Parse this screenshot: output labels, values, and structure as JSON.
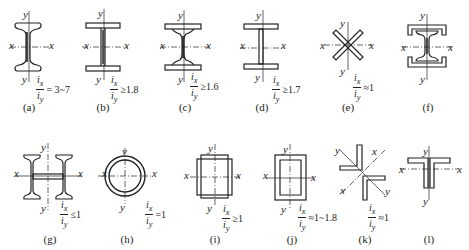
{
  "axes": {
    "x": "x",
    "y": "y"
  },
  "ratio": {
    "num": "i",
    "num_sub": "x",
    "den": "i",
    "den_sub": "y"
  },
  "figures": [
    {
      "id": "a",
      "caption": "(a)",
      "shape": "rolled-i-beam",
      "relation": "= 3~7"
    },
    {
      "id": "b",
      "caption": "(b)",
      "shape": "wide-flange-h-beam",
      "relation": "≥1.8"
    },
    {
      "id": "c",
      "caption": "(c)",
      "shape": "i-beam-with-cover-plates",
      "relation": "≥1.6"
    },
    {
      "id": "d",
      "caption": "(d)",
      "shape": "welded-i-section",
      "relation": "≥1.7"
    },
    {
      "id": "e",
      "caption": "(e)",
      "shape": "cross-plates",
      "relation": "≈1"
    },
    {
      "id": "f",
      "caption": "(f)",
      "shape": "i-beam-with-channels",
      "relation": ""
    },
    {
      "id": "g",
      "caption": "(g)",
      "shape": "double-i-built-up",
      "relation": "≤1"
    },
    {
      "id": "h",
      "caption": "(h)",
      "shape": "circular-tube",
      "relation": "=1"
    },
    {
      "id": "i",
      "caption": "(i)",
      "shape": "plated-box",
      "relation": "≥1"
    },
    {
      "id": "j",
      "caption": "(j)",
      "shape": "channel-box",
      "relation": "≈1~1.8"
    },
    {
      "id": "k",
      "caption": "(k)",
      "shape": "double-angle-star",
      "relation": "≈1"
    },
    {
      "id": "l",
      "caption": "(l)",
      "shape": "double-angle-tee",
      "relation": ""
    }
  ]
}
